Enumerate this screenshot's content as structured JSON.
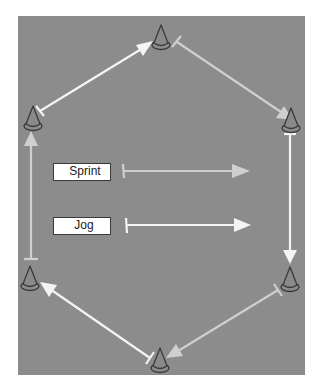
{
  "diagram": {
    "type": "drill-course",
    "field_color": "#8c8c8c",
    "colors": {
      "sprint": "#cfcfcf",
      "jog": "#f4f4f4",
      "cone_fill": "#8a8a8a",
      "cone_outline": "#3a3a3a"
    },
    "legend": [
      {
        "label": "Sprint",
        "line": "sprint"
      },
      {
        "label": "Jog",
        "line": "jog"
      }
    ],
    "cones": [
      {
        "name": "top",
        "x": 161,
        "y": 45
      },
      {
        "name": "upper-right",
        "x": 291,
        "y": 128
      },
      {
        "name": "lower-right",
        "x": 290,
        "y": 287
      },
      {
        "name": "bottom",
        "x": 160,
        "y": 368
      },
      {
        "name": "lower-left",
        "x": 30,
        "y": 286
      },
      {
        "name": "upper-left",
        "x": 33,
        "y": 126
      }
    ],
    "paths": [
      {
        "from": "top",
        "to": "upper-right",
        "type": "sprint"
      },
      {
        "from": "upper-right",
        "to": "lower-right",
        "type": "jog"
      },
      {
        "from": "lower-right",
        "to": "bottom",
        "type": "sprint"
      },
      {
        "from": "bottom",
        "to": "lower-left",
        "type": "jog"
      },
      {
        "from": "lower-left",
        "to": "upper-left",
        "type": "sprint"
      },
      {
        "from": "upper-left",
        "to": "top",
        "type": "jog"
      }
    ]
  }
}
